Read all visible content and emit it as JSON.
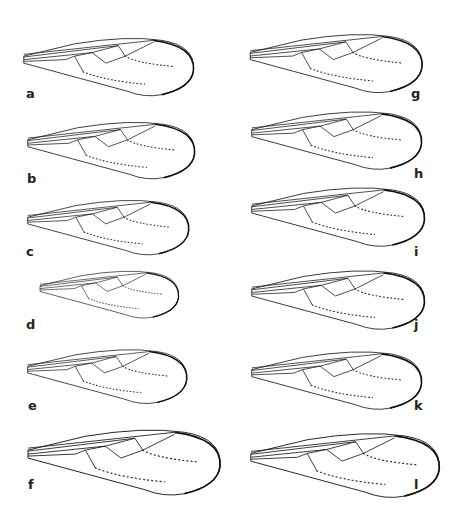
{
  "figure": {
    "left_column": [
      {
        "label": "a"
      },
      {
        "label": "b"
      },
      {
        "label": "c"
      },
      {
        "label": "d"
      },
      {
        "label": "e"
      },
      {
        "label": "f"
      }
    ],
    "right_column": [
      {
        "label": "g"
      },
      {
        "label": "h"
      },
      {
        "label": "i"
      },
      {
        "label": "j"
      },
      {
        "label": "k"
      },
      {
        "label": "l"
      }
    ]
  }
}
